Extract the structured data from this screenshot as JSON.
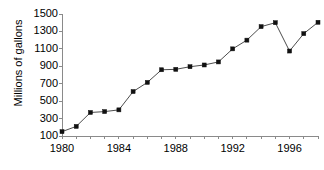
{
  "chart_data": {
    "type": "line",
    "title": "",
    "subtitle": "",
    "xlabel": "",
    "ylabel": "Millions of gallons",
    "x": [
      1980,
      1981,
      1982,
      1983,
      1984,
      1985,
      1986,
      1987,
      1988,
      1989,
      1990,
      1991,
      1992,
      1993,
      1994,
      1995,
      1996,
      1997,
      1998
    ],
    "values": [
      150,
      210,
      370,
      380,
      400,
      610,
      715,
      860,
      865,
      895,
      915,
      950,
      1100,
      1200,
      1355,
      1400,
      1075,
      1275,
      1405
    ],
    "series": [
      {
        "name": "Millions of gallons",
        "values": [
          150,
          210,
          370,
          380,
          400,
          610,
          715,
          860,
          865,
          895,
          915,
          950,
          1100,
          1200,
          1355,
          1400,
          1075,
          1275,
          1405
        ]
      }
    ],
    "ylim": [
      100,
      1500
    ],
    "xlim": [
      1980,
      1998
    ],
    "ytick_labels": [
      "100",
      "300",
      "500",
      "700",
      "900",
      "1100",
      "1300",
      "1500"
    ],
    "ytick_values": [
      100,
      300,
      500,
      700,
      900,
      1100,
      1300,
      1500
    ],
    "xtick_labels": [
      "1980",
      "1984",
      "1988",
      "1992",
      "1996"
    ],
    "xtick_values": [
      1980,
      1984,
      1988,
      1992,
      1996
    ],
    "xtick_minor_values": [
      1980,
      1981,
      1982,
      1983,
      1984,
      1985,
      1986,
      1987,
      1988,
      1989,
      1990,
      1991,
      1992,
      1993,
      1994,
      1995,
      1996,
      1997,
      1998
    ],
    "grid": false,
    "legend": false,
    "legend_position": "none",
    "marker": "square",
    "colors": {
      "line": "#4d4d4d",
      "marker": "#111111",
      "axis": "#8a8a8a",
      "text": "#000000",
      "background": "#ffffff"
    }
  }
}
